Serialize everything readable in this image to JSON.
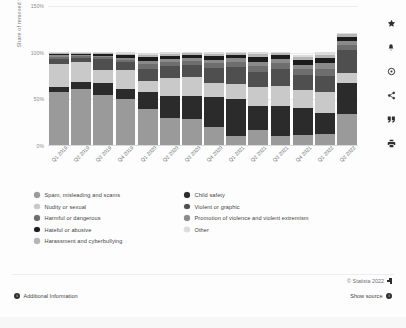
{
  "chart_data": {
    "type": "bar",
    "stacked": true,
    "percent_stacked": false,
    "title": "",
    "xlabel": "",
    "ylabel": "Share of removed videos",
    "ylim": [
      0,
      150
    ],
    "ytick_labels": [
      "0%",
      "50%",
      "100%",
      "150%"
    ],
    "ytick_values": [
      0,
      50,
      100,
      150
    ],
    "grid": true,
    "legend_position": "below",
    "categories": [
      "Q1 2019",
      "Q2 2019",
      "Q3 2019",
      "Q4 2019",
      "Q1 2020",
      "Q2 2020",
      "Q3 2020",
      "Q4 2020",
      "Q1 2021",
      "Q2 2021",
      "Q3 2021",
      "Q4 2021",
      "Q1 2022",
      "Q2 2022"
    ],
    "series": [
      {
        "name": "Spam, misleading and scams",
        "color": "#9a9a9a",
        "values": [
          56.5,
          59.5,
          53.5,
          49.5,
          38.5,
          28.5,
          27.5,
          19.0,
          9.5,
          16.5,
          10.0,
          11.0,
          11.5,
          33.0
        ]
      },
      {
        "name": "Child safety",
        "color": "#2b2b2b",
        "values": [
          6.0,
          7.5,
          12.5,
          10.5,
          18.0,
          24.5,
          25.5,
          32.0,
          40.0,
          25.0,
          32.0,
          29.0,
          22.5,
          33.5
        ]
      },
      {
        "name": "Nudity or sexual",
        "color": "#c9c9c9",
        "values": [
          24.0,
          22.0,
          14.5,
          20.5,
          12.5,
          18.5,
          19.5,
          16.0,
          15.5,
          20.5,
          21.5,
          18.5,
          23.0,
          11.0
        ]
      },
      {
        "name": "Violent or graphic",
        "color": "#4f4f4f",
        "values": [
          6.0,
          4.5,
          11.5,
          8.0,
          12.5,
          13.0,
          13.0,
          16.0,
          19.0,
          16.5,
          17.5,
          16.5,
          16.5,
          24.0
        ]
      },
      {
        "name": "Harmful or dangerous",
        "color": "#6e6e6e",
        "values": [
          2.0,
          1.5,
          2.0,
          2.5,
          5.0,
          4.5,
          4.5,
          5.0,
          5.5,
          6.5,
          6.5,
          6.5,
          8.5,
          5.5
        ]
      },
      {
        "name": "Promotion of violence and violent extremism",
        "color": "#8a8a8a",
        "values": [
          1.5,
          1.0,
          1.5,
          2.5,
          3.5,
          3.0,
          3.0,
          3.5,
          3.5,
          4.5,
          4.5,
          4.5,
          5.5,
          4.5
        ]
      },
      {
        "name": "Hateful or abusive",
        "color": "#1c1c1c",
        "values": [
          1.5,
          1.5,
          2.0,
          3.0,
          4.0,
          3.5,
          3.5,
          4.0,
          3.5,
          5.0,
          4.0,
          5.0,
          5.5,
          4.0
        ]
      },
      {
        "name": "Harassment and cyberbullying",
        "color": "#b5b5b5",
        "values": [
          1.0,
          1.0,
          1.0,
          1.5,
          2.5,
          2.5,
          2.0,
          2.5,
          2.0,
          3.5,
          2.5,
          3.5,
          4.0,
          3.0
        ]
      },
      {
        "name": "Other",
        "color": "#dcdcdc",
        "values": [
          1.0,
          1.0,
          1.0,
          1.5,
          2.0,
          1.5,
          1.5,
          1.5,
          1.5,
          2.0,
          1.5,
          2.0,
          2.5,
          2.0
        ]
      }
    ]
  },
  "legend": {
    "left_column": [
      {
        "label": "Spam, misleading and scams",
        "color": "#9a9a9a"
      },
      {
        "label": "Nudity or sexual",
        "color": "#c9c9c9"
      },
      {
        "label": "Harmful or dangerous",
        "color": "#6e6e6e"
      },
      {
        "label": "Hateful or abusive",
        "color": "#1c1c1c"
      },
      {
        "label": "Harassment and cyberbullying",
        "color": "#b5b5b5"
      }
    ],
    "right_column": [
      {
        "label": "Child safety",
        "color": "#2b2b2b"
      },
      {
        "label": "Violent or graphic",
        "color": "#4f4f4f"
      },
      {
        "label": "Promotion of violence and violent extremism",
        "color": "#8a8a8a"
      },
      {
        "label": "Other",
        "color": "#dcdcdc"
      }
    ]
  },
  "toolbar": {
    "items": [
      {
        "name": "favorite-icon",
        "title": "Add to favorites"
      },
      {
        "name": "alert-icon",
        "title": "Create alert"
      },
      {
        "name": "settings-icon",
        "title": "Settings"
      },
      {
        "name": "share-icon",
        "title": "Share"
      },
      {
        "name": "citation-icon",
        "title": "Cite"
      },
      {
        "name": "print-icon",
        "title": "Print"
      }
    ]
  },
  "footer": {
    "additional_information": "Additional Information",
    "copyright": "© Statista 2022",
    "show_source": "Show source",
    "info_glyph": "i"
  }
}
